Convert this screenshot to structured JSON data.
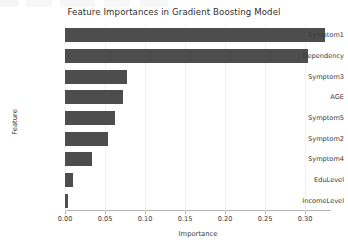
{
  "chart_data": {
    "type": "bar",
    "orientation": "horizontal",
    "title": "Feature Importances in Gradient Boosting Model",
    "xlabel": "Importance",
    "ylabel": "Feature",
    "categories": [
      "Symptom1",
      "Dependency",
      "Symptom3",
      "AGE",
      "Symptom5",
      "Symptom2",
      "Symptom4",
      "EduLevel",
      "IncomeLevel"
    ],
    "values": [
      0.325,
      0.304,
      0.077,
      0.073,
      0.063,
      0.054,
      0.034,
      0.0095,
      0.004
    ],
    "xlim": [
      0.0,
      0.3325
    ],
    "xticks": [
      0.0,
      0.05,
      0.1,
      0.15,
      0.2,
      0.25,
      0.3
    ],
    "xtick_labels": [
      "0.00",
      "0.05",
      "0.10",
      "0.15",
      "0.20",
      "0.25",
      "0.30"
    ],
    "grid": true,
    "grid_axis": "x",
    "legend": "none",
    "bar_color": "#4d4d4d",
    "background_color": "#ffffff",
    "gridline_color": "#f0f0f0"
  }
}
